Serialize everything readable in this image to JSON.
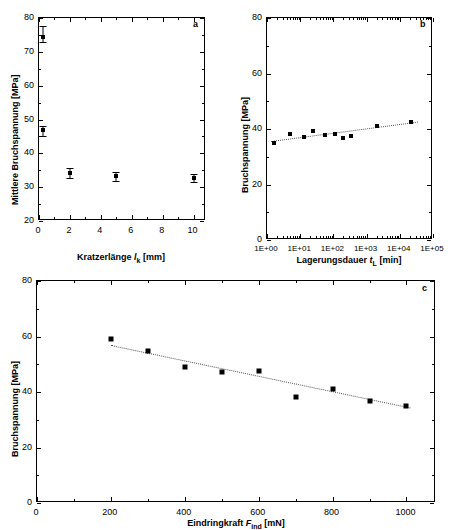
{
  "figure": {
    "panels": [
      "a",
      "b",
      "c"
    ]
  },
  "chart_data": [
    {
      "panel": "a",
      "type": "scatter",
      "title": "",
      "xlabel": "Kratzerlänge l_k [mm]",
      "xlabel_parts": {
        "name": "Kratzerlänge",
        "symbol": "l",
        "subscript": "k",
        "unit": "[mm]"
      },
      "ylabel": "Mittlere Bruchspannung [MPa]",
      "xlim": [
        0,
        10.8
      ],
      "ylim": [
        20,
        80
      ],
      "xticks": [
        0,
        2,
        4,
        6,
        8,
        10
      ],
      "yticks": [
        20,
        30,
        40,
        50,
        60,
        70,
        80
      ],
      "xticklabels": [
        "0",
        "2",
        "4",
        "6",
        "8",
        "10"
      ],
      "yticklabels": [
        "20",
        "30",
        "40",
        "50",
        "60",
        "70",
        "80"
      ],
      "xscale": "linear",
      "yscale": "linear",
      "grid": false,
      "legend": "none",
      "errorbars": true,
      "points": [
        {
          "x": 0.25,
          "y": 74.5,
          "yerr_low": 1.5,
          "yerr_high": 3.2
        },
        {
          "x": 0.25,
          "y": 46.8,
          "yerr_low": 1.6,
          "yerr_high": 1.3
        },
        {
          "x": 2.0,
          "y": 34.2,
          "yerr_low": 1.4,
          "yerr_high": 1.6
        },
        {
          "x": 5.0,
          "y": 33.2,
          "yerr_low": 1.3,
          "yerr_high": 1.4
        },
        {
          "x": 10.0,
          "y": 32.7,
          "yerr_low": 1.2,
          "yerr_high": 1.1
        }
      ]
    },
    {
      "panel": "b",
      "type": "scatter",
      "title": "",
      "xlabel": "Lagerungsdauer t_L [min]",
      "xlabel_parts": {
        "name": "Lagerungsdauer",
        "symbol": "t",
        "subscript": "L",
        "unit": "[min]"
      },
      "ylabel": "Bruchspannung [MPa]",
      "xlim": [
        1,
        100000
      ],
      "ylim": [
        0,
        80
      ],
      "xscale": "log",
      "yscale": "linear",
      "xticks": [
        1,
        10,
        100,
        1000,
        10000,
        100000
      ],
      "xticklabels": [
        "1E+00",
        "1E+01",
        "1E+02",
        "1E+03",
        "1E+04",
        "1E+05"
      ],
      "yticks": [
        0,
        20,
        40,
        60,
        80
      ],
      "yticklabels": [
        "0",
        "20",
        "40",
        "60",
        "80"
      ],
      "grid": false,
      "legend": "none",
      "errorbars": false,
      "points": [
        {
          "x": 1.6,
          "y": 35.1
        },
        {
          "x": 5.0,
          "y": 38.1
        },
        {
          "x": 13.0,
          "y": 37.0
        },
        {
          "x": 25.0,
          "y": 39.2
        },
        {
          "x": 55.0,
          "y": 37.7
        },
        {
          "x": 110.0,
          "y": 38.3
        },
        {
          "x": 200.0,
          "y": 36.8
        },
        {
          "x": 330.0,
          "y": 37.6
        },
        {
          "x": 2000.0,
          "y": 41.0
        },
        {
          "x": 22000.0,
          "y": 42.4
        }
      ],
      "fit": {
        "type": "linear-log",
        "x1": 1.3,
        "y1": 35.6,
        "x2": 35000,
        "y2": 42.6
      }
    },
    {
      "panel": "c",
      "type": "scatter",
      "title": "",
      "xlabel": "Eindringkraft F_ind [mN]",
      "xlabel_parts": {
        "name": "Eindringkraft",
        "symbol": "F",
        "subscript": "ind",
        "unit": "[mN]"
      },
      "ylabel": "Bruchspannung [MPa]",
      "xlim": [
        0,
        1080
      ],
      "ylim": [
        0,
        80
      ],
      "xscale": "linear",
      "yscale": "linear",
      "xticks": [
        0,
        200,
        400,
        600,
        800,
        1000
      ],
      "xticklabels": [
        "0",
        "200",
        "400",
        "600",
        "800",
        "1000"
      ],
      "yticks": [
        0,
        20,
        40,
        60,
        80
      ],
      "yticklabels": [
        "0",
        "20",
        "40",
        "60",
        "80"
      ],
      "grid": false,
      "legend": "none",
      "errorbars": false,
      "points": [
        {
          "x": 200,
          "y": 59.0
        },
        {
          "x": 300,
          "y": 54.6
        },
        {
          "x": 400,
          "y": 48.9
        },
        {
          "x": 500,
          "y": 47.1
        },
        {
          "x": 600,
          "y": 47.4
        },
        {
          "x": 700,
          "y": 38.2
        },
        {
          "x": 800,
          "y": 41.2
        },
        {
          "x": 900,
          "y": 36.8
        },
        {
          "x": 1000,
          "y": 34.8
        }
      ],
      "fit": {
        "type": "linear",
        "x1": 200,
        "y1": 57.0,
        "x2": 1010,
        "y2": 34.5
      }
    }
  ]
}
